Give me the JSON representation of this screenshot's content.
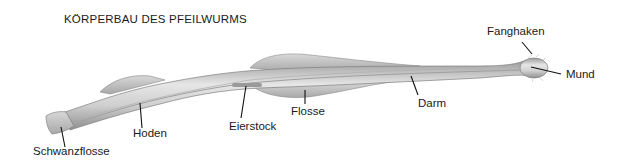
{
  "title": "KÖRPERBAU DES PFEILWURMS",
  "labels": {
    "fanghaken": "Fanghaken",
    "mund": "Mund",
    "darm": "Darm",
    "flosse": "Flosse",
    "eierstock": "Eierstock",
    "hoden": "Hoden",
    "schwanzflosse": "Schwanzflosse"
  },
  "colors": {
    "body": "#c8c8c8",
    "outline": "#8a8a8a",
    "text": "#1a1a1a",
    "background": "#ffffff"
  }
}
